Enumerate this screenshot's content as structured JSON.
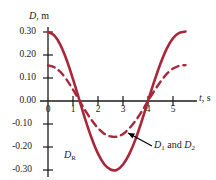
{
  "chart_data": {
    "type": "line",
    "title": "",
    "xlabel": "t, s",
    "ylabel": "D, m",
    "xlim": [
      -0.35,
      5.7
    ],
    "ylim": [
      -0.34,
      0.34
    ],
    "xticks": [
      "0",
      "1",
      "2",
      "3",
      "4",
      "5"
    ],
    "xtick_values": [
      0,
      1,
      2,
      3,
      4,
      5
    ],
    "yticks": [
      "0.30",
      "0.20",
      "0.10",
      "0.00",
      "-0.10",
      "-0.20",
      "-0.30"
    ],
    "ytick_values": [
      0.3,
      0.2,
      0.1,
      0.0,
      -0.1,
      -0.2,
      -0.3
    ],
    "grid": false,
    "legend": "inline-annotations",
    "accent_color": "#a8283a",
    "axis_color": "#1a1a1a",
    "series": [
      {
        "name": "D_R",
        "label": "D_R",
        "style": "solid",
        "amplitude": 0.3,
        "period": 5.5,
        "phase_offset": 0.0,
        "zero_crossings": [
          1.27,
          4.0
        ],
        "minimum": {
          "t": 2.72,
          "D": -0.3
        },
        "x": [
          0,
          0.25,
          0.5,
          0.75,
          1,
          1.25,
          1.5,
          1.75,
          2,
          2.25,
          2.5,
          2.75,
          3,
          3.25,
          3.5,
          3.75,
          4,
          4.25,
          4.5,
          4.75,
          5,
          5.25,
          5.5
        ],
        "values": [
          0.3,
          0.285,
          0.243,
          0.177,
          0.095,
          0.006,
          -0.083,
          -0.163,
          -0.229,
          -0.275,
          -0.298,
          -0.3,
          -0.276,
          -0.231,
          -0.167,
          -0.087,
          0.0,
          0.085,
          0.163,
          0.228,
          0.273,
          0.296,
          0.302
        ]
      },
      {
        "name": "D_1 and D_2",
        "label": "D_1 and D_2",
        "style": "dashed",
        "amplitude": 0.155,
        "period": 5.5,
        "phase_offset": 0.0,
        "zero_crossings": [
          1.27,
          4.0
        ],
        "minimum": {
          "t": 2.72,
          "D": -0.155
        },
        "x": [
          0,
          0.25,
          0.5,
          0.75,
          1,
          1.25,
          1.5,
          1.75,
          2,
          2.25,
          2.5,
          2.75,
          3,
          3.25,
          3.5,
          3.75,
          4,
          4.25,
          4.5,
          4.75,
          5,
          5.25,
          5.5
        ],
        "values": [
          0.155,
          0.147,
          0.126,
          0.092,
          0.049,
          0.003,
          -0.043,
          -0.084,
          -0.118,
          -0.142,
          -0.154,
          -0.155,
          -0.143,
          -0.119,
          -0.086,
          -0.045,
          0.0,
          0.044,
          0.084,
          0.118,
          0.141,
          0.153,
          0.156
        ]
      }
    ],
    "annotations": [
      {
        "name": "resultant-label",
        "text": "D_R",
        "t": 2.15,
        "D": -0.235
      },
      {
        "name": "components-label",
        "text": "D_1 and D_2",
        "t": 3.9,
        "D": -0.205,
        "arrow_to": {
          "t": 3.05,
          "D": -0.152
        }
      }
    ]
  },
  "axis": {
    "y_name": "D",
    "y_unit": "m",
    "y_label_full": "D, m",
    "x_name": "t",
    "x_unit": "s",
    "x_label_full": "t, s"
  },
  "labels": {
    "y0": "0.30",
    "y1": "0.20",
    "y2": "0.10",
    "y3": "0.00",
    "y4": "-0.10",
    "y5": "-0.20",
    "y6": "-0.30",
    "x0": "0",
    "x1": "1",
    "x2": "2",
    "x3": "3",
    "x4": "4",
    "x5": "5",
    "resultant": "D",
    "resultant_sub": "R",
    "components_first": "D",
    "components_first_sub": "1",
    "components_conj": " and ",
    "components_second": "D",
    "components_second_sub": "2"
  }
}
